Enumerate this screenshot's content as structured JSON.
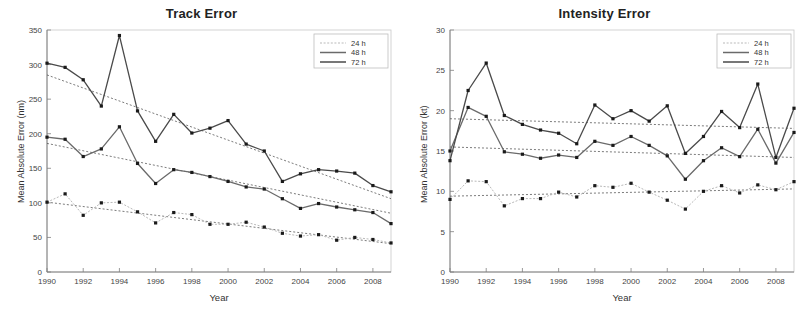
{
  "figure": {
    "background": "#ffffff",
    "width": 807,
    "height": 312,
    "axis_color": "#808080",
    "series_colors": {
      "24 h": "#b9b9b9",
      "48 h": "#6a6a6a",
      "72 h": "#4a4a4a",
      "trend": "#555555",
      "marker": "#1a1a1a"
    }
  },
  "panels": {
    "left": {
      "title": "Track Error",
      "xlabel": "Year",
      "ylabel": "Mean Absolute Error (nm)"
    },
    "right": {
      "title": "Intensity Error",
      "xlabel": "Year",
      "ylabel": "Mean Absolute Error (kt)"
    }
  },
  "legend": {
    "items": [
      {
        "label": "24 h",
        "style": "dotted-light"
      },
      {
        "label": "48 h",
        "style": "solid-medium"
      },
      {
        "label": "72 h",
        "style": "solid-dark"
      }
    ]
  },
  "chart_data": [
    {
      "type": "line",
      "title": "Track Error",
      "xlabel": "Year",
      "ylabel": "Mean Absolute Error (nm)",
      "xlim": [
        1990,
        2009
      ],
      "ylim": [
        0,
        350
      ],
      "xticks": [
        1990,
        1992,
        1994,
        1996,
        1998,
        2000,
        2002,
        2004,
        2006,
        2008
      ],
      "yticks": [
        0,
        50,
        100,
        150,
        200,
        250,
        300,
        350
      ],
      "grid": false,
      "legend_position": "top-right",
      "x": [
        1990,
        1991,
        1992,
        1993,
        1994,
        1995,
        1996,
        1997,
        1998,
        1999,
        2000,
        2001,
        2002,
        2003,
        2004,
        2005,
        2006,
        2007,
        2008,
        2009
      ],
      "series": [
        {
          "name": "24 h",
          "values": [
            101,
            113,
            82,
            100,
            101,
            87,
            71,
            86,
            83,
            69,
            69,
            72,
            65,
            56,
            52,
            54,
            46,
            50,
            47,
            42
          ]
        },
        {
          "name": "48 h",
          "values": [
            195,
            192,
            167,
            178,
            210,
            157,
            128,
            148,
            144,
            138,
            131,
            123,
            120,
            106,
            92,
            99,
            94,
            90,
            86,
            70
          ]
        },
        {
          "name": "72 h",
          "values": [
            302,
            296,
            278,
            240,
            342,
            233,
            189,
            228,
            201,
            208,
            219,
            185,
            175,
            131,
            142,
            148,
            146,
            143,
            125,
            116
          ]
        }
      ],
      "trendlines": [
        {
          "name": "24 h trend",
          "y_start": 101,
          "y_end": 41
        },
        {
          "name": "48 h trend",
          "y_start": 186,
          "y_end": 85
        },
        {
          "name": "72 h trend",
          "y_start": 285,
          "y_end": 106
        }
      ]
    },
    {
      "type": "line",
      "title": "Intensity Error",
      "xlabel": "Year",
      "ylabel": "Mean Absolute Error (kt)",
      "xlim": [
        1990,
        2009
      ],
      "ylim": [
        0,
        30
      ],
      "xticks": [
        1990,
        1992,
        1994,
        1996,
        1998,
        2000,
        2002,
        2004,
        2006,
        2008
      ],
      "yticks": [
        0,
        5,
        10,
        15,
        20,
        25,
        30
      ],
      "grid": false,
      "legend_position": "top-right",
      "x": [
        1990,
        1991,
        1992,
        1993,
        1994,
        1995,
        1996,
        1997,
        1998,
        1999,
        2000,
        2001,
        2002,
        2003,
        2004,
        2005,
        2006,
        2007,
        2008,
        2009
      ],
      "series": [
        {
          "name": "24 h",
          "values": [
            9.0,
            11.3,
            11.2,
            8.2,
            9.1,
            9.1,
            9.9,
            9.3,
            10.7,
            10.5,
            11.0,
            9.9,
            8.9,
            7.8,
            10.0,
            10.7,
            9.8,
            10.8,
            10.2,
            11.2
          ]
        },
        {
          "name": "48 h",
          "values": [
            15.0,
            20.4,
            19.3,
            14.9,
            14.6,
            14.1,
            14.5,
            14.2,
            16.2,
            15.7,
            16.8,
            15.7,
            14.4,
            11.5,
            13.8,
            15.4,
            14.3,
            17.7,
            13.5,
            17.3
          ]
        },
        {
          "name": "72 h",
          "values": [
            13.8,
            22.5,
            25.9,
            19.4,
            18.3,
            17.6,
            17.2,
            15.9,
            20.7,
            19.0,
            20.0,
            18.7,
            20.6,
            14.7,
            16.8,
            19.9,
            17.9,
            23.3,
            14.2,
            20.3
          ]
        }
      ],
      "trendlines": [
        {
          "name": "24 h trend",
          "y_start": 9.4,
          "y_end": 10.3
        },
        {
          "name": "48 h trend",
          "y_start": 15.5,
          "y_end": 14.2
        },
        {
          "name": "72 h trend",
          "y_start": 19.0,
          "y_end": 17.8
        }
      ]
    }
  ]
}
